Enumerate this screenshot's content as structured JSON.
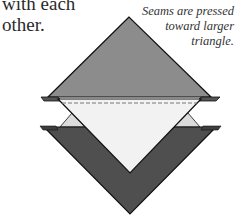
{
  "body_text": {
    "line1": "with each",
    "line2": "other."
  },
  "caption": {
    "line1": "Seams are pressed",
    "line2": "toward larger",
    "line3": "triangle."
  },
  "colors": {
    "top_triangle": "#8c8c8c",
    "light_triangle": "#f2f2f2",
    "dark_triangle": "#4f4f4f",
    "seam_line": "#777777",
    "outline": "#111111"
  }
}
